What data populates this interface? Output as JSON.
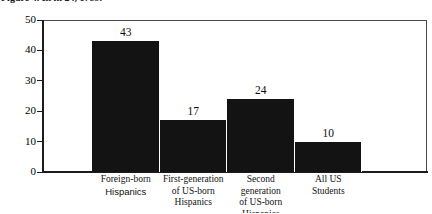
{
  "caption": {
    "text": "Figure 4. In in 24, 1789."
  },
  "chart_data": {
    "type": "bar",
    "title": "",
    "subtitle": "",
    "xlabel": "",
    "ylabel": "",
    "categories": [
      "Foreign-born Hispanics",
      "First-generation of US-born Hispanics",
      "Second generation of US-born Hispanics",
      "All US Students"
    ],
    "category_lines": [
      [
        "Foreign-born",
        "Hispanics"
      ],
      [
        "First-generation",
        "of US-born",
        "Hispanics"
      ],
      [
        "Second",
        "generation",
        "of US-born",
        "Hispanics"
      ],
      [
        "All US",
        "Students"
      ]
    ],
    "values": [
      43,
      17,
      24,
      10
    ],
    "value_labels": [
      "43",
      "17",
      "24",
      "10"
    ],
    "ylim": [
      0,
      50
    ],
    "yticks": [
      0,
      10,
      20,
      30,
      40,
      50
    ],
    "ytick_labels": [
      "0",
      "10",
      "20",
      "30",
      "40",
      "50"
    ],
    "grid": false,
    "legend": false,
    "bar_color": "#131313",
    "axis_color": "#1c1c1c",
    "frame_color": "#4a4a4a"
  }
}
